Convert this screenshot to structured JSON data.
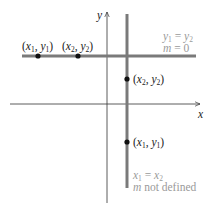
{
  "diagram": {
    "axes": {
      "x_label": "x",
      "y_label": "y"
    },
    "horizontal_line": {
      "points": [
        {
          "label_x": "x",
          "label_x_sub": "1",
          "label_y": "y",
          "label_y_sub": "1"
        },
        {
          "label_x": "x",
          "label_x_sub": "2",
          "label_y": "y",
          "label_y_sub": "2"
        }
      ],
      "equation_line1": {
        "lhs": "y",
        "lhs_sub": "1",
        "op": " = ",
        "rhs": "y",
        "rhs_sub": "2"
      },
      "equation_line2": {
        "var": "m",
        "rest": " = 0"
      }
    },
    "vertical_line": {
      "points": [
        {
          "label_x": "x",
          "label_x_sub": "2",
          "label_y": "y",
          "label_y_sub": "2"
        },
        {
          "label_x": "x",
          "label_x_sub": "1",
          "label_y": "y",
          "label_y_sub": "1"
        }
      ],
      "equation_line1": {
        "lhs": "x",
        "lhs_sub": "1",
        "op": " = ",
        "rhs": "x",
        "rhs_sub": "2"
      },
      "equation_line2": {
        "var": "m",
        "rest": " not defined"
      }
    },
    "colors": {
      "axis": "#333333",
      "line": "#7a7a7a",
      "point": "#111111",
      "annotation": "#9a9a9a"
    }
  }
}
